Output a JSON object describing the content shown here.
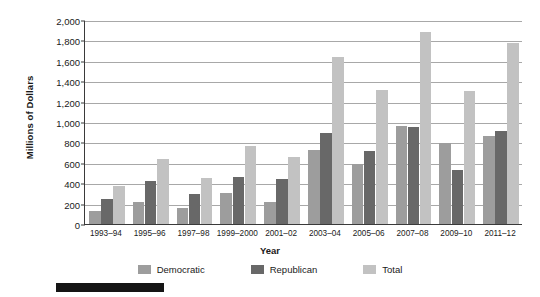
{
  "chart_data": {
    "type": "bar",
    "title": "",
    "xlabel": "Year",
    "ylabel": "Millions of Dollars",
    "ylim": [
      0,
      2000
    ],
    "ytick_step": 200,
    "grid": true,
    "legend_position": "bottom",
    "categories": [
      "1993–94",
      "1995–96",
      "1997–98",
      "1999–2000",
      "2001–02",
      "2003–04",
      "2005–06",
      "2007–08",
      "2009–10",
      "2011–12"
    ],
    "ytick_labels": [
      "0",
      "200",
      "400",
      "600",
      "800",
      "1,000",
      "1,200",
      "1,400",
      "1,600",
      "1,800",
      "2,000"
    ],
    "ytick_values": [
      0,
      200,
      400,
      600,
      800,
      1000,
      1200,
      1400,
      1600,
      1800,
      2000
    ],
    "series": [
      {
        "name": "Democratic",
        "color": "#9d9d9d",
        "values": [
          130,
          215,
          155,
          305,
          215,
          725,
          590,
          965,
          795,
          865
        ]
      },
      {
        "name": "Republican",
        "color": "#686868",
        "values": [
          245,
          420,
          290,
          465,
          445,
          895,
          720,
          950,
          530,
          910
        ]
      },
      {
        "name": "Total",
        "color": "#c2c2c2",
        "values": [
          375,
          640,
          450,
          760,
          655,
          1635,
          1310,
          1880,
          1305,
          1775
        ]
      }
    ]
  },
  "axis": {
    "y_title": "Millions of Dollars",
    "x_title": "Year"
  },
  "legend": {
    "items": [
      {
        "label": "Democratic",
        "color": "#9d9d9d"
      },
      {
        "label": "Republican",
        "color": "#686868"
      },
      {
        "label": "Total",
        "color": "#c2c2c2"
      }
    ]
  }
}
